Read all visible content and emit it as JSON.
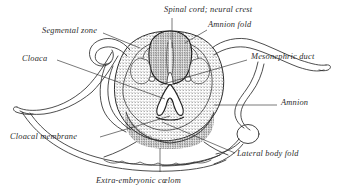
{
  "figure": {
    "background_color": "#ffffff",
    "ink_color": "#2b2b2b",
    "width": 340,
    "height": 192
  },
  "labels": {
    "spinal_cord": "Spinal cord; neural crest",
    "amnion_fold": "Amnion fold",
    "segmental_zone": "Segmental zone",
    "mesonephric_duct": "Mesonephric duct",
    "cloaca": "Cloaca",
    "amnion": "Amnion",
    "cloacal_membrane": "Cloacal membrane",
    "lateral_body_fold": "Lateral body fold"
  },
  "caption": {
    "text": "Extra-embryonic cœlom"
  }
}
